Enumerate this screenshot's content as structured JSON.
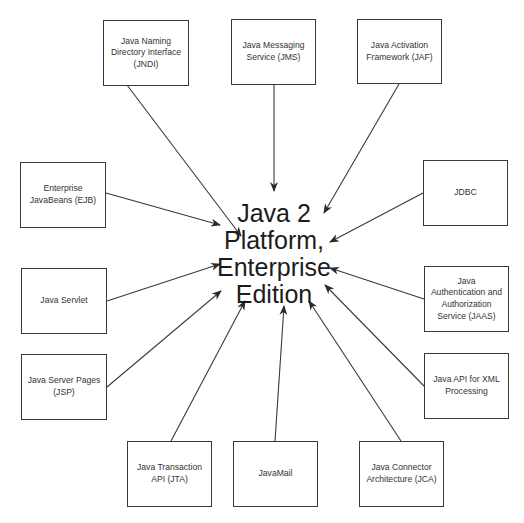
{
  "diagram": {
    "center": {
      "label": "Java 2\nPlatform,\nEnterprise\nEdition"
    },
    "components": [
      {
        "id": "jndi",
        "label": "Java Naming\nDirectory Interface\n(JNDI)",
        "x": 103,
        "y": 20,
        "w": 86,
        "h": 66,
        "arrow_from": [
          127,
          85
        ],
        "arrow_to": [
          241,
          236
        ]
      },
      {
        "id": "jms",
        "label": "Java Messaging\nService (JMS)",
        "x": 231,
        "y": 19,
        "w": 85,
        "h": 66,
        "arrow_from": [
          274,
          85
        ],
        "arrow_to": [
          274,
          191
        ]
      },
      {
        "id": "jaf",
        "label": "Java Activation\nFramework (JAF)",
        "x": 357,
        "y": 19,
        "w": 85,
        "h": 65,
        "arrow_from": [
          399,
          84
        ],
        "arrow_to": [
          324,
          213
        ]
      },
      {
        "id": "ejb",
        "label": "Enterprise\nJavaBeans (EJB)",
        "x": 20,
        "y": 162,
        "w": 86,
        "h": 66,
        "arrow_from": [
          106,
          193
        ],
        "arrow_to": [
          220,
          225
        ]
      },
      {
        "id": "jdbc",
        "label": "JDBC",
        "x": 423,
        "y": 160,
        "w": 85,
        "h": 66,
        "arrow_from": [
          423,
          193
        ],
        "arrow_to": [
          330,
          242
        ]
      },
      {
        "id": "servlet",
        "label": "Java Servlet",
        "x": 21,
        "y": 268,
        "w": 86,
        "h": 66,
        "arrow_from": [
          107,
          301
        ],
        "arrow_to": [
          220,
          264
        ]
      },
      {
        "id": "jaas",
        "label": "Java\nAuthentication and\nAuthorization\nService (JAAS)",
        "x": 424,
        "y": 266,
        "w": 85,
        "h": 66,
        "arrow_from": [
          424,
          299
        ],
        "arrow_to": [
          330,
          268
        ]
      },
      {
        "id": "jsp",
        "label": "Java Server Pages\n(JSP)",
        "x": 21,
        "y": 354,
        "w": 86,
        "h": 66,
        "arrow_from": [
          107,
          387
        ],
        "arrow_to": [
          221,
          291
        ]
      },
      {
        "id": "jaxp",
        "label": "Java API for XML\nProcessing",
        "x": 424,
        "y": 353,
        "w": 85,
        "h": 66,
        "arrow_from": [
          424,
          386
        ],
        "arrow_to": [
          325,
          285
        ]
      },
      {
        "id": "jta",
        "label": "Java Transaction\nAPI (JTA)",
        "x": 127,
        "y": 441,
        "w": 85,
        "h": 66,
        "arrow_from": [
          171,
          441
        ],
        "arrow_to": [
          245,
          301
        ]
      },
      {
        "id": "javamail",
        "label": "JavaMail",
        "x": 233,
        "y": 441,
        "w": 85,
        "h": 66,
        "arrow_from": [
          275,
          441
        ],
        "arrow_to": [
          284,
          306
        ]
      },
      {
        "id": "jca",
        "label": "Java Connector\nArchitecture (JCA)",
        "x": 359,
        "y": 441,
        "w": 85,
        "h": 66,
        "arrow_from": [
          401,
          441
        ],
        "arrow_to": [
          309,
          301
        ]
      }
    ],
    "colors": {
      "line": "#3a3a3a",
      "box_border": "#3a3a3a",
      "text": "#2a2a2a",
      "background": "#ffffff"
    }
  }
}
